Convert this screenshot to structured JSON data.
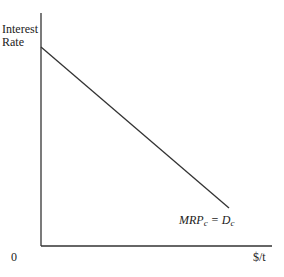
{
  "diagram": {
    "y_axis_label_line1": "Interest",
    "y_axis_label_line2": "Rate",
    "x_axis_label": "$/t",
    "origin_label": "0",
    "curve": {
      "label_main": "MRP",
      "label_sub1": "c",
      "label_eq": " = D",
      "label_sub2": "c",
      "type": "downward-sloping straight line",
      "start": [
        41,
        47
      ],
      "end": [
        229,
        208
      ]
    },
    "line_color": "#333333"
  }
}
